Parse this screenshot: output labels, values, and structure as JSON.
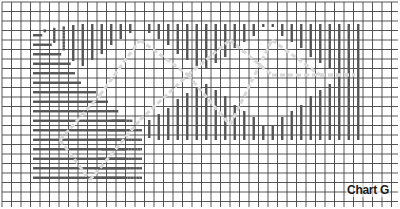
{
  "chart": {
    "label": "Chart G",
    "grid": {
      "cell_px": 9.5,
      "cols": 42,
      "rows": 22,
      "line_color": "#3a3a3a",
      "background": "#ffffff"
    },
    "stitch_color": "#555555",
    "outline_color": "#d8d8d8",
    "regions": [
      {
        "name": "vertical-stripe-field",
        "fill": "vertical-bars"
      },
      {
        "name": "horizontal-stripe-wedge",
        "fill": "horizontal-bars"
      },
      {
        "name": "zigzag-diamond-band",
        "fill": "light-hatch",
        "outline": "dashed"
      }
    ]
  }
}
